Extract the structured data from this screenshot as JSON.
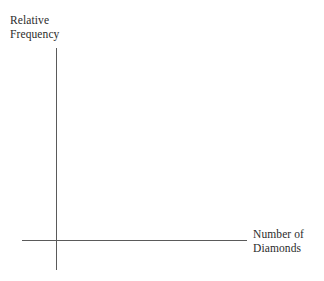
{
  "chart_data": {
    "type": "line",
    "title": "",
    "subtitle": "",
    "xlabel": "Number of Diamonds",
    "ylabel": "Relative Frequency",
    "categories": [],
    "values": [],
    "series": [],
    "annotations": [],
    "legend": {
      "entries": [],
      "position": "none"
    },
    "grid": false,
    "xticks": [],
    "yticks": [],
    "xlim": null,
    "ylim": null,
    "note": "Blank axis template: axes drawn with no data points, no tick marks, and no tick labels."
  },
  "axes": {
    "y_label_line1": "Relative",
    "y_label_line2": "Frequency",
    "x_label_line1": "Number of",
    "x_label_line2": "Diamonds"
  },
  "colors": {
    "background": "#ffffff",
    "axis_line": "#5a5a5a",
    "label_text": "#2b2b2b"
  }
}
